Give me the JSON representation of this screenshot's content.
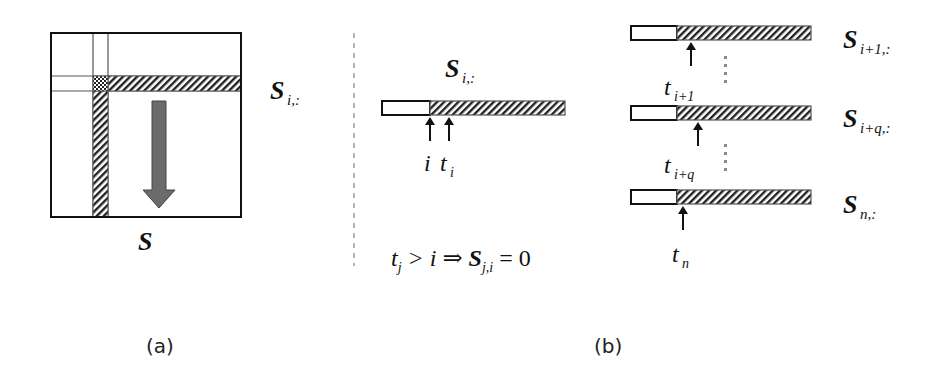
{
  "figure": {
    "panel_a": {
      "caption": "(a)",
      "matrix_label": "S",
      "row_label": {
        "base": "S",
        "sub": "i,:"
      },
      "arrow": "downward-arrow"
    },
    "separator": "dashed-vertical-line",
    "panel_b": {
      "caption": "(b)",
      "center_row": {
        "label": {
          "base": "S",
          "sub": "i,:"
        },
        "pointer_labels": [
          {
            "base": "i",
            "sub": ""
          },
          {
            "base": "t",
            "sub": "i"
          }
        ]
      },
      "rows": [
        {
          "label": {
            "base": "S",
            "sub": "i+1,:"
          },
          "pointer": {
            "base": "t",
            "sub": "i+1"
          }
        },
        {
          "label": {
            "base": "S",
            "sub": "i+q,:"
          },
          "pointer": {
            "base": "t",
            "sub": "i+q"
          }
        },
        {
          "label": {
            "base": "S",
            "sub": "n,:"
          },
          "pointer": {
            "base": "t",
            "sub": "n"
          }
        }
      ],
      "equation": {
        "lhs_base": "t",
        "lhs_sub": "j",
        "op1": " > i ⇒ ",
        "rhs_base": "S",
        "rhs_sub": "j,i",
        "rhs_tail": " = 0"
      }
    },
    "colors": {
      "line": "#111111",
      "arrow_fill": "#6b6b6b",
      "hatch": "#222222",
      "separator": "#9a9a9a"
    }
  }
}
